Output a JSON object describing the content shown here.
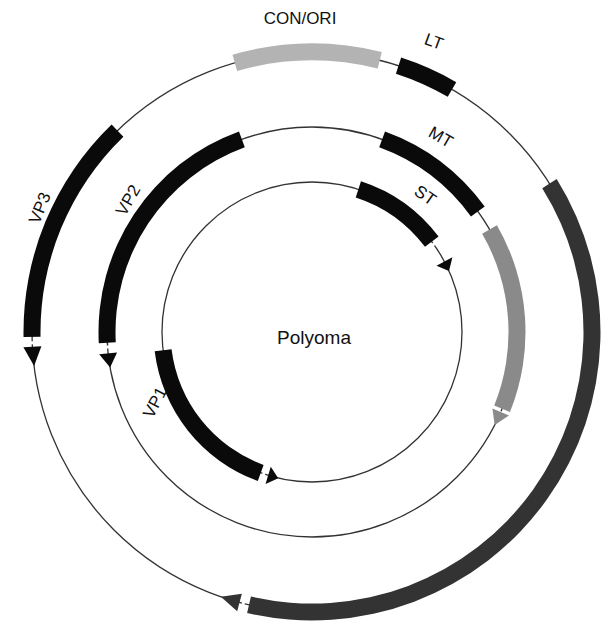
{
  "title": "Polyoma",
  "colors": {
    "black": "#0a0a0a",
    "light_gray": "#b3b3b3",
    "mid_gray": "#8a8a8a",
    "dark_gray": "#333333",
    "line": "#333333"
  },
  "geometry": {
    "cx": 312,
    "cy": 332,
    "rings": {
      "inner": 150,
      "middle": 205,
      "outer": 280
    },
    "band_width": 17
  },
  "genes": [
    {
      "id": "con-ori",
      "label": "CON/ORI",
      "ring": "outer",
      "start": -16,
      "end": 14,
      "color": "light_gray",
      "arrow": null,
      "label_pos": {
        "x": 300,
        "y": 24,
        "rotate": 0
      }
    },
    {
      "id": "lt",
      "label": "LT",
      "ring": "outer",
      "start": 18,
      "end": 30,
      "color": "black",
      "arrow": null,
      "label_pos": {
        "x": 432,
        "y": 47,
        "rotate": 20
      }
    },
    {
      "id": "lt-exon2",
      "label": "",
      "ring": "outer",
      "start": 58,
      "end": 193,
      "color": "dark_gray",
      "arrow": {
        "tip": 199,
        "color": "dark_gray"
      }
    },
    {
      "id": "vp3",
      "label": "VP3",
      "ring": "outer",
      "start": -44,
      "end": -91,
      "color": "black",
      "arrow": {
        "tip": -97,
        "color": "black"
      },
      "label_pos": {
        "x": 45,
        "y": 210,
        "rotate": -68
      }
    },
    {
      "id": "vp2",
      "label": "VP2",
      "ring": "middle",
      "start": -20,
      "end": -93,
      "color": "black",
      "arrow": {
        "tip": -100,
        "color": "black"
      },
      "label_pos": {
        "x": 133,
        "y": 203,
        "rotate": -60
      }
    },
    {
      "id": "mt",
      "label": "MT",
      "ring": "middle",
      "start": 20,
      "end": 54,
      "color": "black",
      "arrow": null,
      "label_pos": {
        "x": 438,
        "y": 142,
        "rotate": 30
      }
    },
    {
      "id": "mt-exon2",
      "label": "",
      "ring": "middle",
      "start": 60,
      "end": 112,
      "color": "mid_gray",
      "arrow": {
        "tip": 117,
        "color": "mid_gray"
      }
    },
    {
      "id": "st",
      "label": "ST",
      "ring": "inner",
      "start": 18,
      "end": 53,
      "color": "black",
      "arrow": {
        "tip": 66,
        "color": "black"
      },
      "label_pos": {
        "x": 422,
        "y": 200,
        "rotate": 35
      }
    },
    {
      "id": "vp1",
      "label": "VP1",
      "ring": "inner",
      "start": -97,
      "end": -160,
      "color": "black",
      "arrow": {
        "tip": -167,
        "color": "black"
      },
      "label_pos": {
        "x": 160,
        "y": 405,
        "rotate": -62
      }
    }
  ]
}
